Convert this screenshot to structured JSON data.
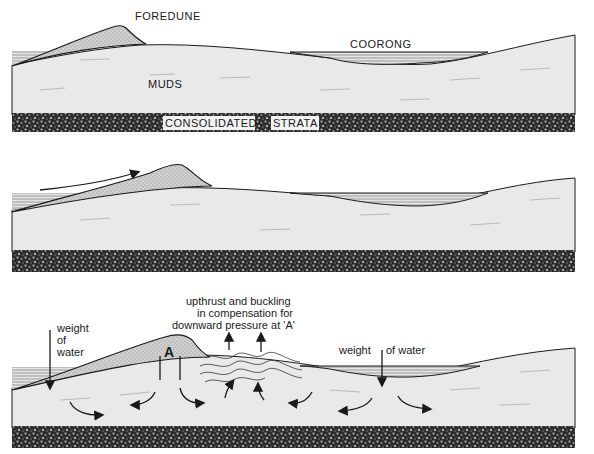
{
  "diagram": {
    "panels": [
      {
        "id": "panel-1",
        "labels": {
          "foredune": "FOREDUNE",
          "coorong": "COORONG",
          "muds": "MUDS",
          "strata_1": "CONSOLIDATED",
          "strata_2": "STRATA"
        }
      },
      {
        "id": "panel-2",
        "labels": {}
      },
      {
        "id": "panel-3",
        "labels": {
          "weight_left_1": "weight",
          "weight_left_2": "of",
          "weight_left_3": "water",
          "point_a": "A",
          "upthrust_1": "upthrust and buckling",
          "upthrust_2": "in compensation for",
          "upthrust_3": "downward pressure at 'A'",
          "weight_right_1": "weight",
          "weight_right_2": "of water"
        }
      }
    ],
    "colors": {
      "mud": "#e9e9e9",
      "dune": "#c9c9c9",
      "water": "#d4d4d4",
      "strata": "#2b2b2b",
      "line": "#1a1a1a"
    }
  }
}
